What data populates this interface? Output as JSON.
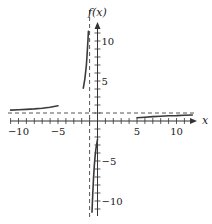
{
  "chart_data": {
    "type": "line",
    "title": "",
    "xlabel": "x",
    "ylabel": "f(x)",
    "xlim": [
      -11.2,
      12
    ],
    "ylim": [
      -11.5,
      11.5
    ],
    "grid": false,
    "x_ticks": [
      -10,
      -5,
      5,
      10
    ],
    "y_ticks": [
      10,
      5,
      -5,
      -10
    ],
    "x_tick_labels": [
      "−10",
      "−5",
      "5",
      "10"
    ],
    "y_tick_labels": [
      "10",
      "5",
      "−5",
      "−10"
    ],
    "asymptotes": {
      "vertical": -1,
      "horizontal": 1
    },
    "series": [
      {
        "name": "branch-left-far",
        "x": [
          -11,
          -10,
          -9,
          -8,
          -7,
          -6,
          -5
        ],
        "y": [
          1.36,
          1.4,
          1.45,
          1.51,
          1.6,
          1.72,
          1.9
        ]
      },
      {
        "name": "branch-left-near",
        "x": [
          -1.8,
          -1.6,
          -1.4,
          -1.3,
          -1.2,
          -1.15
        ],
        "y": [
          4.1,
          5.3,
          7.0,
          8.5,
          10.2,
          11.2
        ]
      },
      {
        "name": "branch-right-near",
        "x": [
          -0.7,
          -0.6,
          -0.5,
          -0.4,
          -0.3,
          -0.2,
          0
        ],
        "y": [
          -11.4,
          -9.0,
          -7.2,
          -5.6,
          -4.4,
          -3.5,
          -2.3
        ]
      },
      {
        "name": "branch-right-far",
        "x": [
          5,
          6,
          7,
          8,
          9,
          10,
          11,
          12
        ],
        "y": [
          0.4,
          0.48,
          0.55,
          0.6,
          0.65,
          0.68,
          0.72,
          0.75
        ]
      }
    ]
  },
  "labels": {
    "x_axis": "x",
    "y_axis": "f(x)"
  },
  "colors": {
    "curve": "#3a3a3a",
    "axis": "#333333",
    "dashed": "#555555"
  }
}
